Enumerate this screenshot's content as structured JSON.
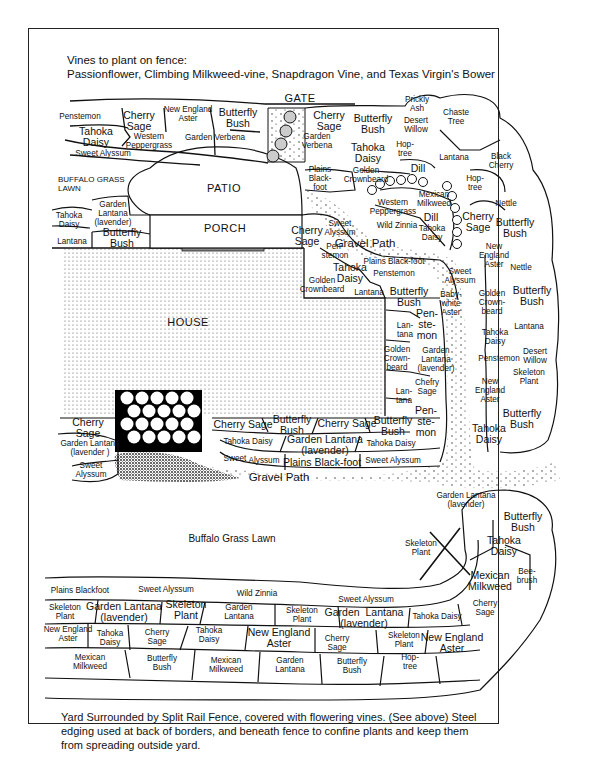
{
  "header": {
    "line1": "Vines to plant on fence:",
    "line2": "Passionflower, Climbing Milkweed-vine, Snapdragon Vine, and Texas Virgin's Bower"
  },
  "footer": {
    "note": "Yard Surrounded by Split Rail Fence, covered with flowering vines.  (See above) Steel edging used at back of borders, and beneath fence to confine plants and keep them from spreading outside yard."
  },
  "structures": {
    "gate": "GATE",
    "patio": "PATIO",
    "porch": "PORCH",
    "house": "HOUSE",
    "lawn_upper": "BUFFALO GRASS\nLAWN",
    "lawn_center": "Buffalo Grass Lawn",
    "gravel_path_upper": "Gravel Path",
    "gravel_path_lower": "Gravel Path"
  },
  "plants": {
    "top_left_border": [
      {
        "label": "Penstemon",
        "x": 80,
        "y": 116
      },
      {
        "label": "Cherry\nSage",
        "x": 139,
        "y": 121,
        "big": true
      },
      {
        "label": "New England\nAster",
        "x": 188,
        "y": 114
      },
      {
        "label": "Butterfly\nBush",
        "x": 238,
        "y": 118,
        "big": true
      },
      {
        "label": "Tahoka\nDaisy",
        "x": 96,
        "y": 137,
        "big": true
      },
      {
        "label": "Western\nPeppergrass",
        "x": 149,
        "y": 141
      },
      {
        "label": "Garden Verbena",
        "x": 215,
        "y": 137
      },
      {
        "label": "Sweet Alyssum",
        "x": 103,
        "y": 153
      }
    ],
    "top_right_border": [
      {
        "label": "Cherry\nSage",
        "x": 329,
        "y": 121,
        "big": true
      },
      {
        "label": "Butterfly\nBush",
        "x": 373,
        "y": 124,
        "big": true
      },
      {
        "label": "Garden\nVerbena",
        "x": 317,
        "y": 141
      },
      {
        "label": "Prickly\nAsh",
        "x": 417,
        "y": 104
      },
      {
        "label": "Desert\nWillow",
        "x": 416,
        "y": 125
      },
      {
        "label": "Chaste\nTree",
        "x": 456,
        "y": 117
      },
      {
        "label": "Tahoka\nDaisy",
        "x": 368,
        "y": 153,
        "big": true
      },
      {
        "label": "Hop-\ntree",
        "x": 405,
        "y": 149
      },
      {
        "label": "Lantana",
        "x": 454,
        "y": 157
      },
      {
        "label": "Black\nCherry",
        "x": 501,
        "y": 161
      },
      {
        "label": "Plains\nBlack-\nfoot",
        "x": 320,
        "y": 178
      },
      {
        "label": "Golden\nCrownbeard",
        "x": 366,
        "y": 175
      },
      {
        "label": "Dill",
        "x": 418,
        "y": 168,
        "big": true
      },
      {
        "label": "Hop-\ntree",
        "x": 475,
        "y": 183
      },
      {
        "label": "Mexican\nMilkweed",
        "x": 434,
        "y": 199
      },
      {
        "label": "Western\nPeppergrass",
        "x": 393,
        "y": 207
      },
      {
        "label": "Dill",
        "x": 431,
        "y": 217,
        "big": true
      },
      {
        "label": "Nettle",
        "x": 506,
        "y": 203
      },
      {
        "label": "Wild Zinnia",
        "x": 397,
        "y": 225
      },
      {
        "label": "Tahoka\nDaisy",
        "x": 432,
        "y": 233
      },
      {
        "label": "Cherry\nSage",
        "x": 478,
        "y": 222,
        "big": true
      },
      {
        "label": "Butterfly\nBush",
        "x": 515,
        "y": 228,
        "big": true
      }
    ],
    "left_of_house": [
      {
        "label": "Garden\nLantana\n(lavender)",
        "x": 113,
        "y": 213
      },
      {
        "label": "Tahoka\nDaisy",
        "x": 69,
        "y": 220
      },
      {
        "label": "Lantana",
        "x": 72,
        "y": 241
      },
      {
        "label": "Butterfly\nBush",
        "x": 122,
        "y": 238,
        "big": true
      }
    ],
    "east_of_house": [
      {
        "label": "Cherry\nSage",
        "x": 307,
        "y": 236,
        "big": true
      },
      {
        "label": "Sweet\nAlyssum",
        "x": 340,
        "y": 228
      },
      {
        "label": "Pen-\nstemon",
        "x": 335,
        "y": 251
      },
      {
        "label": "Plains Black-foot",
        "x": 394,
        "y": 261
      },
      {
        "label": "Tahoka\nDaisy",
        "x": 350,
        "y": 273,
        "big": true
      },
      {
        "label": "Penstemon",
        "x": 394,
        "y": 273
      },
      {
        "label": "Golden\nCrownbeard",
        "x": 322,
        "y": 285
      },
      {
        "label": "Lantana",
        "x": 369,
        "y": 292
      },
      {
        "label": "Butterfly\nBush",
        "x": 409,
        "y": 297,
        "big": true
      },
      {
        "label": "Baby-\nwhite\nAster",
        "x": 451,
        "y": 303
      },
      {
        "label": "Sweet\nAlyssum",
        "x": 460,
        "y": 276
      },
      {
        "label": "Lan-\ntana",
        "x": 405,
        "y": 330
      },
      {
        "label": "Pen-\nste-\nmon",
        "x": 427,
        "y": 324,
        "big": true
      },
      {
        "label": "Golden\nCrown-\nbeard",
        "x": 397,
        "y": 358
      },
      {
        "label": "Garden\nLantana\n(lavender)",
        "x": 436,
        "y": 359
      },
      {
        "label": "Chefry\nSage",
        "x": 427,
        "y": 387
      },
      {
        "label": "Lan-\ntana",
        "x": 404,
        "y": 396
      },
      {
        "label": "Pen-\nste-\nmon",
        "x": 426,
        "y": 421,
        "big": true
      }
    ],
    "right_column": [
      {
        "label": "New\nEngland\nAster",
        "x": 494,
        "y": 255
      },
      {
        "label": "Nettle",
        "x": 521,
        "y": 267
      },
      {
        "label": "Golden\nCrown-\nbeard",
        "x": 492,
        "y": 302
      },
      {
        "label": "Butterfly\nBush",
        "x": 532,
        "y": 296,
        "big": true
      },
      {
        "label": "Lantana",
        "x": 529,
        "y": 326
      },
      {
        "label": "Tahoka\nDaisy",
        "x": 495,
        "y": 337
      },
      {
        "label": "Penstemon",
        "x": 499,
        "y": 358
      },
      {
        "label": "Desert\nWillow",
        "x": 535,
        "y": 356
      },
      {
        "label": "Skeleton\nPlant",
        "x": 529,
        "y": 377
      },
      {
        "label": "New\nEngland\nAster",
        "x": 490,
        "y": 390
      },
      {
        "label": "Butterfly\nBush",
        "x": 522,
        "y": 419,
        "big": true
      },
      {
        "label": "Tahoka\nDaisy",
        "x": 489,
        "y": 434,
        "big": true
      }
    ],
    "south_of_house": [
      {
        "label": "Cherry\nSage",
        "x": 88,
        "y": 428,
        "big": true
      },
      {
        "label": "Garden Lantana\n(lavender )",
        "x": 90,
        "y": 448
      },
      {
        "label": "Sweet\nAlyssum",
        "x": 91,
        "y": 470
      },
      {
        "label": "Butterfly\nBush",
        "x": 292,
        "y": 425,
        "big": true
      },
      {
        "label": "Cherry Sage",
        "x": 347,
        "y": 423,
        "big": true
      },
      {
        "label": "Butterfly\nBush",
        "x": 393,
        "y": 426,
        "big": true
      },
      {
        "label": "Cherry Sage",
        "x": 243,
        "y": 424,
        "big": true
      },
      {
        "label": "Tahoka Daisy",
        "x": 248,
        "y": 441
      },
      {
        "label": "Garden Lantana\n(lavender)",
        "x": 325,
        "y": 445,
        "big": true
      },
      {
        "label": "Tahoka Daisy",
        "x": 391,
        "y": 443
      },
      {
        "label": "Sweet",
        "x": 235,
        "y": 458
      },
      {
        "label": "Alyssum",
        "x": 264,
        "y": 460
      },
      {
        "label": "Plains Black-foot",
        "x": 322,
        "y": 462,
        "big": true
      },
      {
        "label": "Sweet Alyssum",
        "x": 393,
        "y": 460
      }
    ],
    "bottom_right_border": [
      {
        "label": "Garden Lantana\n(lavender)",
        "x": 466,
        "y": 500
      },
      {
        "label": "Butterfly\nBush",
        "x": 523,
        "y": 522,
        "big": true
      },
      {
        "label": "Skeleton\nPlant",
        "x": 421,
        "y": 548
      },
      {
        "label": "Tahoka\nDaisy",
        "x": 504,
        "y": 546,
        "big": true
      },
      {
        "label": "Mexican\nMilkweed",
        "x": 490,
        "y": 581,
        "big": true
      },
      {
        "label": "Bee-\nbrush",
        "x": 527,
        "y": 576
      }
    ],
    "bottom_border": [
      {
        "label": "Plains Blackfoot",
        "x": 80,
        "y": 590
      },
      {
        "label": "Sweet Alyssum",
        "x": 166,
        "y": 589
      },
      {
        "label": "Wild Zinnia",
        "x": 257,
        "y": 593
      },
      {
        "label": "Sweet Alyssum",
        "x": 366,
        "y": 599
      },
      {
        "label": "Skeleton\nPlant",
        "x": 65,
        "y": 612
      },
      {
        "label": "Garden Lantana\n(lavender)",
        "x": 124,
        "y": 612,
        "big": true
      },
      {
        "label": "Skeleton\nPlant",
        "x": 186,
        "y": 610,
        "big": true
      },
      {
        "label": "Garden\nLantana",
        "x": 239,
        "y": 612
      },
      {
        "label": "Skeleton\nPlant",
        "x": 302,
        "y": 615
      },
      {
        "label": "Garden  Lantana\n(lavender)",
        "x": 364,
        "y": 618,
        "big": true
      },
      {
        "label": "Tahoka Daisy",
        "x": 437,
        "y": 616
      },
      {
        "label": "Cherry\nSage",
        "x": 485,
        "y": 608
      },
      {
        "label": "New England\nAster",
        "x": 68,
        "y": 634
      },
      {
        "label": "Tahoka\nDaisy",
        "x": 110,
        "y": 638
      },
      {
        "label": "Cherry\nSage",
        "x": 157,
        "y": 637
      },
      {
        "label": "Tahoka\nDaisy",
        "x": 209,
        "y": 635
      },
      {
        "label": "New England\nAster",
        "x": 279,
        "y": 638,
        "big": true
      },
      {
        "label": "Cherry\nSage",
        "x": 337,
        "y": 643
      },
      {
        "label": "Skeleton\nPlant",
        "x": 404,
        "y": 640
      },
      {
        "label": "New England\nAster",
        "x": 452,
        "y": 643,
        "big": true
      },
      {
        "label": "Mexican\nMilkweed",
        "x": 90,
        "y": 662
      },
      {
        "label": "Butterfly\nBush",
        "x": 162,
        "y": 663
      },
      {
        "label": "Mexican\nMilkweed",
        "x": 226,
        "y": 665
      },
      {
        "label": "Garden\nLantana",
        "x": 290,
        "y": 665
      },
      {
        "label": "Butterfly\nBush",
        "x": 352,
        "y": 666
      },
      {
        "label": "Hop-\ntree",
        "x": 410,
        "y": 662
      }
    ]
  }
}
